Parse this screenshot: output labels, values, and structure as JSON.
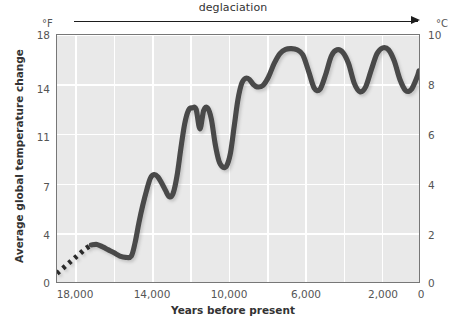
{
  "annotation": {
    "deglaciation_label": "deglaciation",
    "arrow_icon": "right-arrow-icon"
  },
  "axes": {
    "left_unit": "°F",
    "right_unit": "°C",
    "ylabel": "Average global temperature change",
    "xlabel": "Years before present",
    "left_ticks": [
      "18",
      "14",
      "11",
      "7",
      "4",
      "0"
    ],
    "right_ticks": [
      "10",
      "8",
      "6",
      "4",
      "2",
      "0"
    ],
    "x_ticks": [
      "18,000",
      "14,000",
      "10,000",
      "6,000",
      "2,000",
      "0"
    ]
  },
  "style": {
    "plot_background": "#e9e9e9",
    "grid_color": "#ffffff",
    "curve_color": "#4a4a4a",
    "frame_color": "#777777",
    "text_color": "#555555"
  },
  "chart_data": {
    "type": "line",
    "title": "",
    "xlabel": "Years before present",
    "ylabel": "Average global temperature change",
    "xlim": [
      19000,
      0
    ],
    "x_inverted": true,
    "ylim_f": [
      0,
      18
    ],
    "ylim_c": [
      0,
      10
    ],
    "left_axis_unit": "°F",
    "right_axis_unit": "°C",
    "grid": true,
    "legend": null,
    "annotations": [
      {
        "text": "deglaciation",
        "type": "arrow",
        "from_x": 18500,
        "to_x": 300
      }
    ],
    "series": [
      {
        "name": "Average global temperature change",
        "style_note": "dotted for oldest segment (~19,000-17,200 yr BP), solid thereafter",
        "x": [
          19000,
          18700,
          18400,
          18100,
          17800,
          17500,
          17200,
          16900,
          16600,
          16300,
          16000,
          15700,
          15400,
          15100,
          14900,
          14700,
          14500,
          14300,
          14100,
          13900,
          13700,
          13500,
          13300,
          13100,
          12900,
          12700,
          12500,
          12300,
          12100,
          11900,
          11700,
          11500,
          11300,
          11100,
          10900,
          10700,
          10500,
          10300,
          10100,
          9900,
          9700,
          9500,
          9300,
          9100,
          8900,
          8700,
          8500,
          8200,
          7900,
          7600,
          7300,
          7000,
          6700,
          6400,
          6100,
          5800,
          5500,
          5200,
          4900,
          4600,
          4300,
          4000,
          3700,
          3400,
          3100,
          2800,
          2500,
          2200,
          1900,
          1600,
          1300,
          1000,
          700,
          400,
          100,
          0
        ],
        "y_c": [
          0.35,
          0.55,
          0.75,
          0.95,
          1.15,
          1.35,
          1.5,
          1.52,
          1.42,
          1.3,
          1.18,
          1.05,
          1.0,
          1.05,
          1.6,
          2.4,
          3.1,
          3.7,
          4.2,
          4.35,
          4.25,
          4.0,
          3.7,
          3.45,
          3.6,
          4.3,
          5.4,
          6.4,
          6.95,
          7.05,
          7.0,
          6.2,
          6.95,
          7.05,
          6.6,
          5.6,
          4.9,
          4.65,
          4.7,
          5.2,
          6.3,
          7.4,
          8.05,
          8.25,
          8.2,
          8.0,
          7.9,
          7.95,
          8.3,
          8.85,
          9.25,
          9.42,
          9.45,
          9.4,
          9.2,
          8.55,
          7.85,
          7.8,
          8.4,
          9.15,
          9.4,
          9.3,
          8.85,
          8.05,
          7.7,
          7.9,
          8.6,
          9.25,
          9.48,
          9.4,
          8.95,
          8.2,
          7.75,
          7.8,
          8.3,
          8.55
        ],
        "y_f_note": "°F change = °C change × 1.8"
      }
    ]
  }
}
